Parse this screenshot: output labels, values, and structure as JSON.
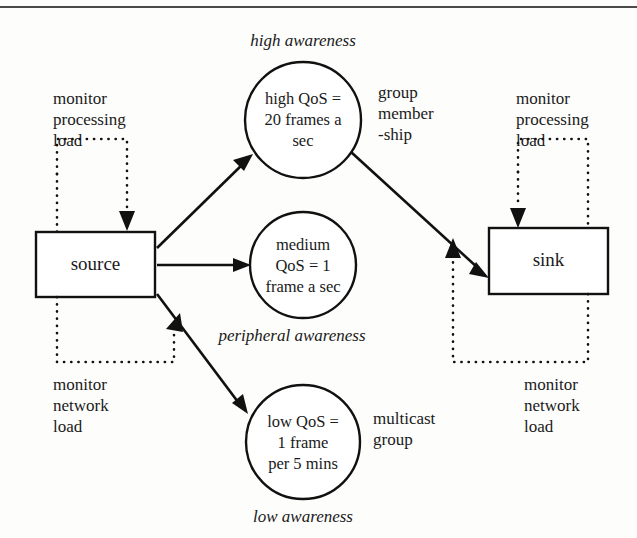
{
  "figure": {
    "nodes": {
      "source": "source",
      "sink": "sink"
    },
    "qos_groups": [
      {
        "id": "high",
        "lines": [
          "high QoS =",
          "20 frames a",
          "sec"
        ],
        "awareness": "high awareness",
        "awareness_position": "above"
      },
      {
        "id": "medium",
        "lines": [
          "medium",
          "QoS = 1",
          "frame a sec"
        ],
        "awareness": "peripheral awareness",
        "awareness_position": "below"
      },
      {
        "id": "low",
        "lines": [
          "low QoS =",
          "1 frame",
          "per 5 mins"
        ],
        "awareness": "low awareness",
        "awareness_position": "below"
      }
    ],
    "annotations": {
      "source_processing": [
        "monitor",
        "processing",
        "load"
      ],
      "source_network": [
        "monitor",
        "network",
        "load"
      ],
      "sink_processing": [
        "monitor",
        "processing",
        "load"
      ],
      "sink_network": [
        "monitor",
        "network",
        "load"
      ],
      "group_membership": [
        "group",
        "member",
        "-ship"
      ],
      "multicast_group": [
        "multicast",
        "group"
      ]
    },
    "colors": {
      "stroke": "#111111",
      "text": "#1a1a1a",
      "background": "#fdfdfc",
      "rule": "#4a4a4a"
    }
  }
}
